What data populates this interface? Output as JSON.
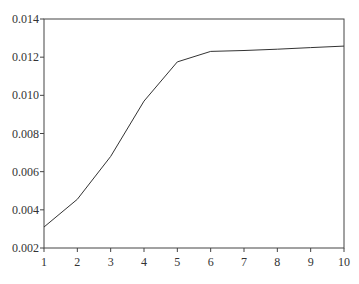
{
  "chart_data": {
    "type": "line",
    "title": "",
    "xlabel": "",
    "ylabel": "",
    "x": [
      1,
      2,
      3,
      4,
      5,
      6,
      7,
      8,
      9,
      10
    ],
    "series": [
      {
        "name": "series",
        "values": [
          0.0031,
          0.00455,
          0.0068,
          0.0097,
          0.01175,
          0.0123,
          0.01235,
          0.01242,
          0.0125,
          0.01258
        ]
      }
    ],
    "xlim": [
      1,
      10
    ],
    "ylim": [
      0.002,
      0.014
    ],
    "xticks": [
      "1",
      "2",
      "3",
      "4",
      "5",
      "6",
      "7",
      "8",
      "9",
      "10"
    ],
    "yticks": [
      "0.002",
      "0.004",
      "0.006",
      "0.008",
      "0.010",
      "0.012",
      "0.014"
    ],
    "grid": false,
    "legend": null,
    "line_color": "#333333"
  }
}
